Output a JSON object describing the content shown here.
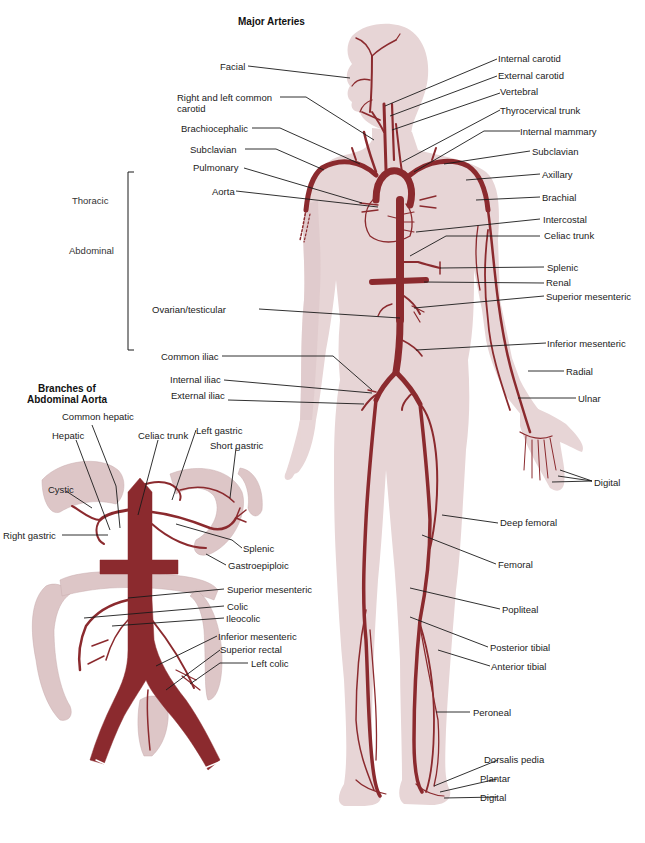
{
  "diagram": {
    "title": "Major Arteries",
    "inset_title_line1": "Branches of",
    "inset_title_line2": "Abdominal Aorta",
    "aorta_sections": [
      "Thoracic",
      "Abdominal"
    ],
    "colors": {
      "body_fill": "#e7d5d6",
      "body_fill_dark": "#dcc5c6",
      "artery": "#8b2a2e",
      "leader_line": "#1a1a1a",
      "text": "#222222"
    },
    "labels_left": [
      {
        "id": "facial",
        "text": "Facial"
      },
      {
        "id": "common-carotid",
        "text": "Right and left common"
      },
      {
        "id": "common-carotid-2",
        "text": "carotid"
      },
      {
        "id": "brachiocephalic",
        "text": "Brachiocephalic"
      },
      {
        "id": "subclavian-left",
        "text": "Subclavian"
      },
      {
        "id": "pulmonary",
        "text": "Pulmonary"
      },
      {
        "id": "aorta",
        "text": "Aorta"
      },
      {
        "id": "ovarian-testicular",
        "text": "Ovarian/testicular"
      },
      {
        "id": "common-iliac",
        "text": "Common iliac"
      },
      {
        "id": "internal-iliac",
        "text": "Internal iliac"
      },
      {
        "id": "external-iliac",
        "text": "External iliac"
      }
    ],
    "labels_right": [
      {
        "id": "internal-carotid",
        "text": "Internal carotid"
      },
      {
        "id": "external-carotid",
        "text": "External carotid"
      },
      {
        "id": "vertebral",
        "text": "Vertebral"
      },
      {
        "id": "thyrocervical-trunk",
        "text": "Thyrocervical trunk"
      },
      {
        "id": "internal-mammary",
        "text": "Internal mammary"
      },
      {
        "id": "subclavian-right",
        "text": "Subclavian"
      },
      {
        "id": "axillary",
        "text": "Axillary"
      },
      {
        "id": "brachial",
        "text": "Brachial"
      },
      {
        "id": "intercostal",
        "text": "Intercostal"
      },
      {
        "id": "celiac-trunk",
        "text": "Celiac trunk"
      },
      {
        "id": "splenic",
        "text": "Splenic"
      },
      {
        "id": "renal",
        "text": "Renal"
      },
      {
        "id": "superior-mesenteric",
        "text": "Superior mesenteric"
      },
      {
        "id": "inferior-mesenteric",
        "text": "Inferior mesenteric"
      },
      {
        "id": "radial",
        "text": "Radial"
      },
      {
        "id": "ulnar",
        "text": "Ulnar"
      },
      {
        "id": "digital-hand",
        "text": "Digital"
      },
      {
        "id": "deep-femoral",
        "text": "Deep femoral"
      },
      {
        "id": "femoral",
        "text": "Femoral"
      },
      {
        "id": "popliteal",
        "text": "Popliteal"
      },
      {
        "id": "posterior-tibial",
        "text": "Posterior tibial"
      },
      {
        "id": "anterior-tibial",
        "text": "Anterior tibial"
      },
      {
        "id": "peroneal",
        "text": "Peroneal"
      },
      {
        "id": "dorsalis-pedia",
        "text": "Dorsalis pedia"
      },
      {
        "id": "plantar",
        "text": "Plantar"
      },
      {
        "id": "digital-foot",
        "text": "Digital"
      }
    ],
    "inset_labels": [
      {
        "id": "common-hepatic",
        "text": "Common hepatic"
      },
      {
        "id": "hepatic",
        "text": "Hepatic"
      },
      {
        "id": "celiac-trunk",
        "text": "Celiac trunk"
      },
      {
        "id": "left-gastric",
        "text": "Left gastric"
      },
      {
        "id": "short-gastric",
        "text": "Short gastric"
      },
      {
        "id": "cystic",
        "text": "Cystic"
      },
      {
        "id": "right-gastric",
        "text": "Right gastric"
      },
      {
        "id": "splenic",
        "text": "Splenic"
      },
      {
        "id": "gastroepiploic",
        "text": "Gastroepiploic"
      },
      {
        "id": "superior-mesenteric",
        "text": "Superior mesenteric"
      },
      {
        "id": "colic",
        "text": "Colic"
      },
      {
        "id": "ileocolic",
        "text": "Ileocolic"
      },
      {
        "id": "inferior-mesenteric",
        "text": "Inferior mesenteric"
      },
      {
        "id": "superior-rectal",
        "text": "Superior rectal"
      },
      {
        "id": "left-colic",
        "text": "Left colic"
      }
    ]
  }
}
